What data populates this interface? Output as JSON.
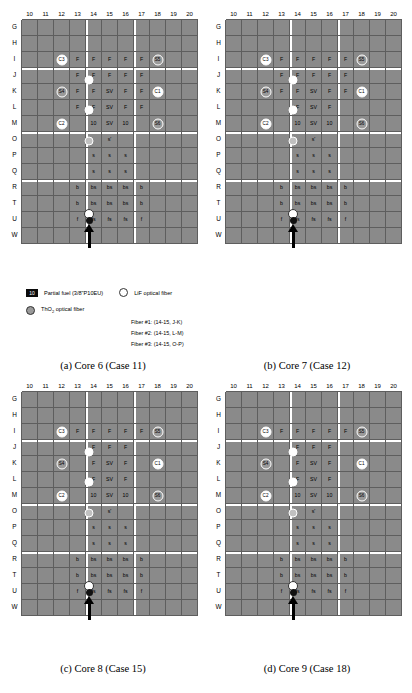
{
  "figure": {
    "columns": [
      "10",
      "11",
      "12",
      "13",
      "14",
      "15",
      "16",
      "17",
      "18",
      "19",
      "20"
    ],
    "rows": [
      "G",
      "H",
      "I",
      "J",
      "K",
      "L",
      "M",
      "O",
      "P",
      "Q",
      "R",
      "T",
      "U",
      "W"
    ],
    "legend": {
      "partial_fuel_swatch": "10",
      "partial_fuel_label": "Partial fuel (3/8\"P10EU)",
      "lif_label": "LiF optical fiber",
      "thoria_label": "ThO2 optical fiber",
      "fibers": [
        "Fiber #1: (14-15, J-K)",
        "Fiber #2: (14-15, L-M)",
        "Fiber #3: (14-15, O-P)"
      ]
    },
    "cell_labels": {
      "fuel": "F",
      "sv": "SV",
      "partial": "10",
      "s": "s",
      "s_prime": "s'",
      "b": "b",
      "bs": "bs",
      "f": "f",
      "fs": "fs"
    },
    "circle_labels": [
      "C3",
      "S5",
      "S4",
      "C1",
      "C2",
      "S6"
    ],
    "colors": {
      "fuel_black": "#0b0b0b",
      "grid_grey": "#8a8a8a",
      "light_grey": "#c9c9c9",
      "white": "#ffffff",
      "thoria_fill": "#9a9a9a"
    },
    "panels": [
      {
        "id": "a",
        "caption": "(a) Core 6 (Case 11)"
      },
      {
        "id": "b",
        "caption": "(b) Core 7 (Case 12)"
      },
      {
        "id": "c",
        "caption": "(c) Core 8 (Case 15)"
      },
      {
        "id": "d",
        "caption": "(d) Core 9 (Case 18)"
      }
    ],
    "grids": {
      "a": [
        [
          "gry",
          "gry",
          "gry",
          "gry",
          "gry",
          "gry",
          "gry",
          "gry",
          "gry",
          "gry",
          "gry"
        ],
        [
          "gry",
          "gry",
          "gry",
          "gry",
          "gry",
          "gry",
          "gry",
          "gry",
          "gry",
          "gry",
          "gry"
        ],
        [
          "gry",
          "gry",
          "C3",
          "F",
          "F",
          "F",
          "F",
          "F",
          "S5",
          "gry",
          "gry"
        ],
        [
          "gry",
          "gry",
          "gry",
          "F",
          "F",
          "F",
          "F",
          "F",
          "gry",
          "gry",
          "gry"
        ],
        [
          "gry",
          "gry",
          "S4",
          "F",
          "F",
          "SV",
          "F",
          "F",
          "C1",
          "gry",
          "gry"
        ],
        [
          "gry",
          "gry",
          "gry",
          "F",
          "F",
          "SV",
          "F",
          "F",
          "gry",
          "gry",
          "gry"
        ],
        [
          "gry",
          "gry",
          "C2",
          "gry",
          "10",
          "SV",
          "10",
          "gry",
          "S6",
          "gry",
          "gry"
        ],
        [
          "gry",
          "gry",
          "gry",
          "gry",
          "gry",
          "s'",
          "gry",
          "gry",
          "gry",
          "gry",
          "gry"
        ],
        [
          "gry",
          "gry",
          "gry",
          "gry",
          "s",
          "s",
          "s",
          "gry",
          "gry",
          "gry",
          "gry"
        ],
        [
          "gry",
          "gry",
          "gry",
          "gry",
          "s",
          "s",
          "s",
          "gry",
          "gry",
          "gry",
          "gry"
        ],
        [
          "gry",
          "gry",
          "gry",
          "b",
          "bs",
          "bs",
          "bs",
          "b",
          "gry",
          "gry",
          "gry"
        ],
        [
          "gry",
          "gry",
          "gry",
          "b",
          "bs",
          "bs",
          "bs",
          "b",
          "gry",
          "gry",
          "gry"
        ],
        [
          "gry",
          "gry",
          "gry",
          "f",
          "fs",
          "fs",
          "fs",
          "f",
          "gry",
          "gry",
          "gry"
        ],
        [
          "wht",
          "wht",
          "wht",
          "wht",
          "wht",
          "wht",
          "wht",
          "wht",
          "wht",
          "wht",
          "wht"
        ]
      ],
      "b": [
        [
          "gry",
          "gry",
          "gry",
          "gry",
          "gry",
          "gry",
          "gry",
          "gry",
          "gry",
          "gry",
          "gry"
        ],
        [
          "gry",
          "gry",
          "gry",
          "gry",
          "gry",
          "gry",
          "gry",
          "gry",
          "gry",
          "gry",
          "gry"
        ],
        [
          "gry",
          "gry",
          "C3",
          "F",
          "F",
          "F",
          "F",
          "F",
          "S5",
          "gry",
          "gry"
        ],
        [
          "gry",
          "gry",
          "gry",
          "F",
          "F",
          "F",
          "F",
          "F",
          "gry",
          "gry",
          "gry"
        ],
        [
          "gry",
          "gry",
          "S4",
          "F",
          "F",
          "SV",
          "F",
          "F",
          "C1",
          "gry",
          "gry"
        ],
        [
          "gry",
          "gry",
          "gry",
          "gry",
          "F",
          "SV",
          "F",
          "gry",
          "gry",
          "gry",
          "gry"
        ],
        [
          "gry",
          "gry",
          "C2",
          "gry",
          "10",
          "SV",
          "10",
          "gry",
          "S6",
          "gry",
          "gry"
        ],
        [
          "gry",
          "gry",
          "gry",
          "gry",
          "gry",
          "s'",
          "gry",
          "gry",
          "gry",
          "gry",
          "gry"
        ],
        [
          "gry",
          "gry",
          "gry",
          "gry",
          "s",
          "s",
          "s",
          "gry",
          "gry",
          "gry",
          "gry"
        ],
        [
          "gry",
          "gry",
          "gry",
          "gry",
          "s",
          "s",
          "s",
          "gry",
          "gry",
          "gry",
          "gry"
        ],
        [
          "gry",
          "gry",
          "gry",
          "b",
          "bs",
          "bs",
          "bs",
          "b",
          "gry",
          "gry",
          "gry"
        ],
        [
          "gry",
          "gry",
          "gry",
          "b",
          "bs",
          "bs",
          "bs",
          "b",
          "gry",
          "gry",
          "gry"
        ],
        [
          "gry",
          "gry",
          "gry",
          "f",
          "fs",
          "fs",
          "fs",
          "f",
          "gry",
          "gry",
          "gry"
        ],
        [
          "wht",
          "wht",
          "wht",
          "wht",
          "wht",
          "wht",
          "wht",
          "wht",
          "wht",
          "wht",
          "wht"
        ]
      ],
      "c": [
        [
          "gry",
          "gry",
          "gry",
          "gry",
          "gry",
          "gry",
          "gry",
          "gry",
          "gry",
          "gry",
          "gry"
        ],
        [
          "gry",
          "gry",
          "gry",
          "gry",
          "gry",
          "gry",
          "gry",
          "gry",
          "gry",
          "gry",
          "gry"
        ],
        [
          "gry",
          "gry",
          "C3",
          "F",
          "F",
          "F",
          "F",
          "F",
          "S5",
          "gry",
          "gry"
        ],
        [
          "gry",
          "gry",
          "gry",
          "gry",
          "F",
          "F",
          "F",
          "gry",
          "gry",
          "gry",
          "gry"
        ],
        [
          "gry",
          "gry",
          "S4",
          "gry",
          "F",
          "SV",
          "F",
          "gry",
          "C1",
          "gry",
          "gry"
        ],
        [
          "gry",
          "gry",
          "gry",
          "gry",
          "F",
          "SV",
          "F",
          "gry",
          "gry",
          "gry",
          "gry"
        ],
        [
          "gry",
          "gry",
          "C2",
          "gry",
          "10",
          "SV",
          "10",
          "gry",
          "S6",
          "gry",
          "gry"
        ],
        [
          "gry",
          "gry",
          "gry",
          "gry",
          "gry",
          "s'",
          "gry",
          "gry",
          "gry",
          "gry",
          "gry"
        ],
        [
          "gry",
          "gry",
          "gry",
          "gry",
          "s",
          "s",
          "s",
          "gry",
          "gry",
          "gry",
          "gry"
        ],
        [
          "gry",
          "gry",
          "gry",
          "gry",
          "s",
          "s",
          "s",
          "gry",
          "gry",
          "gry",
          "gry"
        ],
        [
          "gry",
          "gry",
          "gry",
          "b",
          "bs",
          "bs",
          "bs",
          "b",
          "gry",
          "gry",
          "gry"
        ],
        [
          "gry",
          "gry",
          "gry",
          "b",
          "bs",
          "bs",
          "bs",
          "b",
          "gry",
          "gry",
          "gry"
        ],
        [
          "gry",
          "gry",
          "gry",
          "f",
          "fs",
          "fs",
          "fs",
          "f",
          "gry",
          "gry",
          "gry"
        ],
        [
          "wht",
          "wht",
          "wht",
          "wht",
          "wht",
          "wht",
          "wht",
          "wht",
          "wht",
          "wht",
          "wht"
        ]
      ],
      "d": [
        [
          "gry",
          "gry",
          "gry",
          "gry",
          "gry",
          "gry",
          "gry",
          "gry",
          "gry",
          "gry",
          "gry"
        ],
        [
          "gry",
          "gry",
          "gry",
          "gry",
          "gry",
          "gry",
          "gry",
          "gry",
          "gry",
          "gry",
          "gry"
        ],
        [
          "gry",
          "gry",
          "C3",
          "F",
          "F",
          "F",
          "F",
          "F",
          "S5",
          "gry",
          "gry"
        ],
        [
          "gry",
          "gry",
          "gry",
          "gry",
          "F",
          "F",
          "F",
          "gry",
          "gry",
          "gry",
          "gry"
        ],
        [
          "gry",
          "gry",
          "S4",
          "gry",
          "F",
          "SV",
          "F",
          "gry",
          "C1",
          "gry",
          "gry"
        ],
        [
          "gry",
          "gry",
          "gry",
          "gry",
          "F",
          "SV",
          "F",
          "gry",
          "gry",
          "gry",
          "gry"
        ],
        [
          "gry",
          "gry",
          "C2",
          "gry",
          "10",
          "SV",
          "10",
          "gry",
          "S6",
          "gry",
          "gry"
        ],
        [
          "gry",
          "gry",
          "gry",
          "gry",
          "gry",
          "s'",
          "gry",
          "gry",
          "gry",
          "gry",
          "gry"
        ],
        [
          "gry",
          "gry",
          "gry",
          "gry",
          "s",
          "s",
          "s",
          "gry",
          "gry",
          "gry",
          "gry"
        ],
        [
          "gry",
          "gry",
          "gry",
          "gry",
          "s",
          "s",
          "s",
          "gry",
          "gry",
          "gry",
          "gry"
        ],
        [
          "gry",
          "gry",
          "gry",
          "b",
          "bs",
          "bs",
          "bs",
          "b",
          "gry",
          "gry",
          "gry"
        ],
        [
          "gry",
          "gry",
          "gry",
          "b",
          "bs",
          "bs",
          "bs",
          "b",
          "gry",
          "gry",
          "gry"
        ],
        [
          "gry",
          "gry",
          "gry",
          "f",
          "fs",
          "fs",
          "fs",
          "f",
          "gry",
          "gry",
          "gry"
        ],
        [
          "wht",
          "wht",
          "wht",
          "wht",
          "wht",
          "wht",
          "wht",
          "wht",
          "wht",
          "wht",
          "wht"
        ]
      ]
    }
  }
}
